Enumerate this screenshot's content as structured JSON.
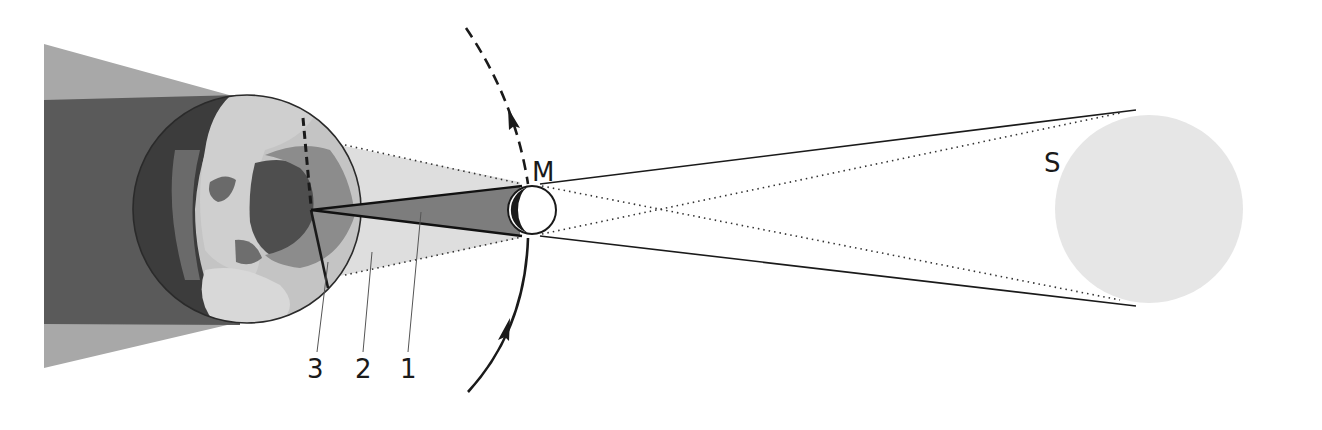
{
  "diagram": {
    "type": "solar-eclipse",
    "bodies": {
      "moon_label": "M",
      "sun_label": "S"
    },
    "callouts": [
      {
        "number": "3",
        "target": "totality-path-line"
      },
      {
        "number": "2",
        "target": "penumbra"
      },
      {
        "number": "1",
        "target": "umbra"
      }
    ],
    "colors": {
      "background": "#ffffff",
      "earth_shadow_dark": "#5a5a5a",
      "earth_shadow_light": "#a8a8a8",
      "penumbra": "#dedede",
      "umbra": "#7d7d7d",
      "sun": "#e6e6e6",
      "moon": "#ffffff",
      "line": "#1a1a1a"
    }
  }
}
